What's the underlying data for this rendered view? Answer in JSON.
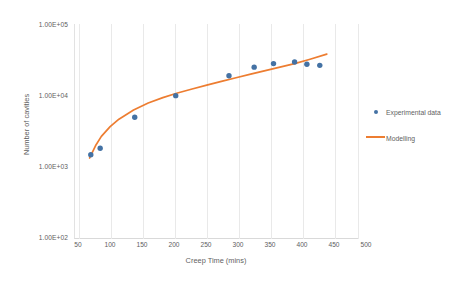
{
  "chart_data": {
    "type": "scatter",
    "title": "",
    "xlabel": "Creep Time (mins)",
    "ylabel": "Number of cavities",
    "xlim": [
      25,
      510
    ],
    "ylim": [
      100,
      100000
    ],
    "yscale": "log",
    "xscale": "linear",
    "grid": true,
    "grid_axis": "x",
    "legend_position": "right",
    "x_ticks": [
      "50",
      "100",
      "150",
      "200",
      "250",
      "300",
      "350",
      "400",
      "450",
      "500"
    ],
    "x_tick_values": [
      50,
      100,
      150,
      200,
      250,
      300,
      350,
      400,
      450,
      500
    ],
    "y_ticks": [
      "1.00E+05",
      "1.00E+04",
      "1.00E+03",
      "1.00E+02"
    ],
    "y_tick_values": [
      100000,
      10000,
      1000,
      100
    ],
    "series": [
      {
        "name": "Experimental data",
        "type": "scatter",
        "color": "#4472a4",
        "marker": "circle",
        "x": [
          52,
          68,
          127,
          197,
          288,
          331,
          364,
          400,
          421,
          443
        ],
        "values": [
          1500,
          1850,
          5000,
          10000,
          19000,
          25000,
          28000,
          29500,
          27500,
          26500
        ]
      },
      {
        "name": "Modelling",
        "type": "line",
        "color": "#ed7d31",
        "x": [
          50,
          60,
          70,
          85,
          100,
          125,
          150,
          175,
          200,
          225,
          250,
          275,
          300,
          325,
          350,
          375,
          400,
          425,
          455
        ],
        "values": [
          1350,
          2000,
          2700,
          3700,
          4700,
          6300,
          7900,
          9400,
          10900,
          12400,
          14000,
          15800,
          17800,
          20000,
          22400,
          25000,
          28000,
          32000,
          38000
        ]
      }
    ]
  },
  "axes": {
    "x_title": "Creep Time (mins)",
    "y_title": "Number of cavities"
  },
  "legend": {
    "items": [
      {
        "label": "Experimental data",
        "marker": "dot",
        "color": "#4472a4"
      },
      {
        "label": "Modelling",
        "marker": "line",
        "color": "#ed7d31"
      }
    ]
  },
  "colors": {
    "experimental": "#4472a4",
    "modelling": "#ed7d31",
    "grid": "#e8e8e8",
    "axis": "#d9d9d9",
    "text": "#5f5f5f",
    "background": "#ffffff"
  }
}
